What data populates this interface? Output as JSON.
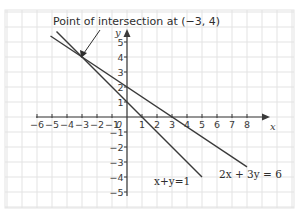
{
  "chart_data": {
    "type": "line",
    "title": "",
    "xlabel": "x",
    "ylabel": "y",
    "xlim": [
      -6,
      8
    ],
    "ylim": [
      -5,
      5
    ],
    "grid": true,
    "x_ticks": [
      "-6",
      "-5",
      "-4",
      "-3",
      "-2",
      "-1",
      "0",
      "1",
      "2",
      "3",
      "4",
      "5",
      "6",
      "7",
      "8"
    ],
    "y_ticks": [
      "5",
      "4",
      "3",
      "2",
      "1",
      "-1",
      "-2",
      "-3",
      "-4",
      "-5"
    ],
    "series": [
      {
        "name": "x + y = 1",
        "label": "x+y=1",
        "equation": "y = 1 - x",
        "x": [
          -4.7,
          5
        ],
        "y": [
          5.7,
          -4
        ]
      },
      {
        "name": "2x + 3y = 6",
        "label": "2x + 3y = 6",
        "equation": "y = 2 - (2/3)x",
        "x": [
          -5.1,
          8
        ],
        "y": [
          5.4,
          -3.33
        ]
      }
    ],
    "annotations": [
      {
        "text": "Point of intersection at (−3, 4)",
        "point": [
          -3,
          4
        ]
      }
    ]
  },
  "labels": {
    "annotation": "Point of intersection at (−3, 4)",
    "eq1": "x+y=1",
    "eq2": "2x + 3y = 6",
    "x_axis": "x",
    "y_axis": "y"
  }
}
